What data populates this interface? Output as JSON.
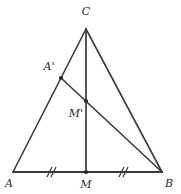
{
  "figure": {
    "type": "euclidean-geometry-diagram",
    "background_color": "#ffffff",
    "stroke_color": "#3a3a3a",
    "label_color": "#2b2b2b",
    "width": 181,
    "height": 194
  },
  "points": [
    {
      "id": "A",
      "label": "A",
      "x": 13,
      "y": 172,
      "label_x": 9,
      "label_y": 187,
      "dot": false
    },
    {
      "id": "B",
      "label": "B",
      "x": 162,
      "y": 172,
      "label_x": 169,
      "label_y": 187,
      "dot": false
    },
    {
      "id": "C",
      "label": "C",
      "x": 86,
      "y": 29,
      "label_x": 86,
      "label_y": 15,
      "dot": false
    },
    {
      "id": "M",
      "label": "M",
      "x": 86,
      "y": 172,
      "label_x": 86,
      "label_y": 188,
      "dot": true
    },
    {
      "id": "Ap",
      "label": "A'",
      "x": 61,
      "y": 78,
      "label_x": 49,
      "label_y": 70,
      "dot": true
    },
    {
      "id": "Mp",
      "label": "M'",
      "x": 86,
      "y": 101,
      "label_x": 76,
      "label_y": 117,
      "dot": true
    }
  ],
  "segments": [
    {
      "id": "AB",
      "from": "A",
      "to": "B",
      "name": "segment-ab"
    },
    {
      "id": "AC",
      "from": "A",
      "to": "C",
      "name": "segment-ac"
    },
    {
      "id": "CB",
      "from": "C",
      "to": "B",
      "name": "segment-cb"
    },
    {
      "id": "CM",
      "from": "C",
      "to": "M",
      "name": "segment-cm-median"
    },
    {
      "id": "ApB",
      "from": "Ap",
      "to": "B",
      "name": "segment-aprime-b"
    }
  ],
  "tick_marks": [
    {
      "id": "tick-am",
      "on": "AM",
      "count": 2,
      "x": 50,
      "y": 172,
      "label": "//"
    },
    {
      "id": "tick-mb",
      "on": "MB",
      "count": 2,
      "x": 122,
      "y": 172,
      "label": "//"
    }
  ],
  "stroke_widths": {
    "base": 1.9,
    "side": 1.5,
    "cevian": 1.5,
    "tick": 1.2
  }
}
